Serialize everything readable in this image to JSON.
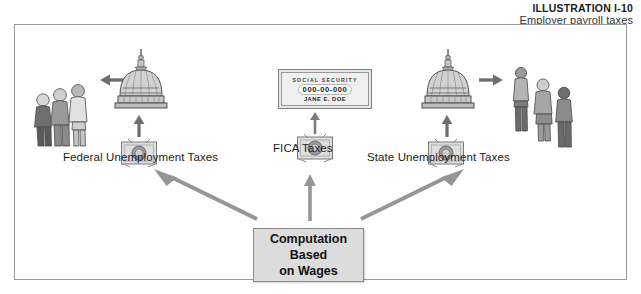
{
  "header": {
    "title": "ILLUSTRATION I-10",
    "subtitle": "Employer payroll taxes"
  },
  "diagram": {
    "center_box": {
      "line1": "Computation",
      "line2": "Based",
      "line3": "on Wages"
    },
    "labels": {
      "left": "Federal Unemployment Taxes",
      "center": "FICA Taxes",
      "right": "State Unemployment Taxes"
    },
    "social_security_card": {
      "heading": "SOCIAL SECURITY",
      "number": "000-00-000",
      "name": "JANE E. DOE"
    },
    "icons": {
      "left_money": "money-icon",
      "center_money": "money-icon",
      "right_money": "money-icon",
      "left_dome": "capitol-dome-icon",
      "right_dome": "capitol-dome-icon",
      "left_people": "people-group-icon",
      "right_people": "people-group-icon",
      "arrow_left": "arrow-left-icon",
      "arrow_right": "arrow-right-icon",
      "arrow_up_left_branch": "arrow-up-left-icon",
      "arrow_up_center_branch": "arrow-up-icon",
      "arrow_up_right_branch": "arrow-up-right-icon",
      "arrow_up_left_money": "arrow-up-icon",
      "arrow_up_center_money": "arrow-up-icon",
      "arrow_up_right_money": "arrow-up-icon"
    }
  },
  "colors": {
    "panel_border": "#9a9a9a",
    "box_fill": "#dcdcdc",
    "arrow_gray": "#8f8f8f",
    "figure_gray": "#a8a8a8",
    "text_dark": "#1c1c1c"
  }
}
